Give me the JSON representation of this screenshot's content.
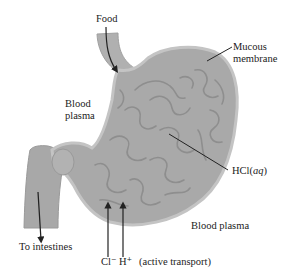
{
  "diagram": {
    "labels": {
      "food": "Food",
      "mucous_line1": "Mucous",
      "mucous_line2": "membrane",
      "blood_plasma_left_line1": "Blood",
      "blood_plasma_left_line2": "plasma",
      "hcl_prefix": "HCl(",
      "hcl_state": "aq",
      "hcl_suffix": ")",
      "blood_plasma_right": "Blood plasma",
      "to_intestines": "To intestines",
      "cl_ion": "Cl⁻",
      "h_ion": "H⁺",
      "active_transport": "(active transport)"
    },
    "colors": {
      "tissue": "#a9a9a9",
      "tissue_edge": "#bdbdbd",
      "folds": "#8e8e8e",
      "arrow": "#222222",
      "text": "#222222",
      "background": "#ffffff"
    }
  }
}
